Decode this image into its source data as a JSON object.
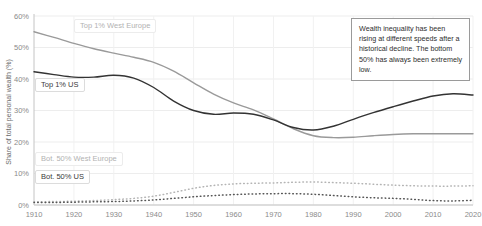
{
  "chart_data": {
    "type": "line",
    "title": "",
    "xlabel": "",
    "ylabel": "Share of total personal wealth (%)",
    "xlim": [
      1910,
      2020
    ],
    "ylim": [
      0,
      60
    ],
    "grid": true,
    "legend_position": "inline-labels",
    "ytick_labels": [
      "0%",
      "10%",
      "20%",
      "30%",
      "40%",
      "50%",
      "60%"
    ],
    "ytick_values": [
      0,
      10,
      20,
      30,
      40,
      50,
      60
    ],
    "xtick_labels": [
      "1910",
      "1920",
      "1930",
      "1940",
      "1950",
      "1960",
      "1970",
      "1980",
      "1990",
      "2000",
      "2010",
      "2020"
    ],
    "xtick_values": [
      1910,
      1920,
      1930,
      1940,
      1950,
      1960,
      1970,
      1980,
      1990,
      2000,
      2010,
      2020
    ],
    "x": [
      1910,
      1915,
      1920,
      1925,
      1930,
      1935,
      1940,
      1945,
      1950,
      1955,
      1960,
      1965,
      1970,
      1975,
      1980,
      1985,
      1990,
      1995,
      2000,
      2005,
      2010,
      2015,
      2020
    ],
    "series": [
      {
        "name": "Top 1% West Europe",
        "style": "solid",
        "color": "#9a9a9a",
        "values": [
          55.0,
          53.2,
          51.3,
          49.6,
          48.2,
          46.9,
          45.3,
          42.5,
          38.8,
          35.2,
          32.4,
          30.2,
          27.3,
          24.2,
          22.0,
          21.4,
          21.5,
          22.0,
          22.4,
          22.6,
          22.6,
          22.6,
          22.6
        ]
      },
      {
        "name": "Top 1% US",
        "style": "solid",
        "color": "#333333",
        "values": [
          42.3,
          41.4,
          40.6,
          40.6,
          41.2,
          40.3,
          37.3,
          33.0,
          30.0,
          28.8,
          29.2,
          28.8,
          27.0,
          24.6,
          23.8,
          25.0,
          27.2,
          29.3,
          31.2,
          33.0,
          34.6,
          35.3,
          34.9
        ]
      },
      {
        "name": "Bot. 50% West Europe",
        "style": "dotted",
        "color": "#b4b4b4",
        "values": [
          1.0,
          1.1,
          1.2,
          1.4,
          1.7,
          2.1,
          2.8,
          4.0,
          5.3,
          6.2,
          6.7,
          6.9,
          7.0,
          7.2,
          7.3,
          7.1,
          6.9,
          6.6,
          6.3,
          6.1,
          6.0,
          6.0,
          6.1
        ]
      },
      {
        "name": "Bot. 50% US",
        "style": "dotted",
        "color": "#555555",
        "values": [
          0.8,
          0.8,
          0.9,
          1.0,
          1.1,
          1.3,
          1.6,
          2.1,
          2.6,
          3.0,
          3.3,
          3.5,
          3.6,
          3.6,
          3.4,
          3.0,
          2.6,
          2.3,
          2.1,
          1.8,
          1.4,
          1.3,
          1.5
        ]
      }
    ]
  },
  "labels": {
    "top1_west_europe": "Top 1% West Europe",
    "top1_us": "Top 1% US",
    "bot50_west_europe": "Bot. 50% West Europe",
    "bot50_us": "Bot. 50% US"
  },
  "annotation": {
    "text": "Wealth inequality has been rising at different speeds after a historical decline. The bottom 50% has always been extremely low."
  }
}
